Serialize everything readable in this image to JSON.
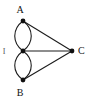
{
  "figure": {
    "name": "multigraph-diagram",
    "background": "#ffffff",
    "stroke_color": "#1c1c1c",
    "vertex_color": "#101010",
    "width": 88,
    "height": 101
  },
  "vertices": [
    {
      "id": "A",
      "label": "A",
      "x": 23,
      "y": 21,
      "label_x": 20,
      "label_y": 13
    },
    {
      "id": "I",
      "label": "I",
      "x": 23,
      "y": 51,
      "label_x": 4,
      "label_y": 54
    },
    {
      "id": "B",
      "label": "B",
      "x": 23,
      "y": 80,
      "label_x": 20,
      "label_y": 96
    },
    {
      "id": "C",
      "label": "C",
      "x": 72,
      "y": 51,
      "label_x": 78,
      "label_y": 54
    }
  ],
  "edges": [
    {
      "id": "A-I-left",
      "from": "A",
      "to": "I",
      "type": "curve",
      "bow": "left",
      "d": "M 23 21 C 12 29 12 43 23 51"
    },
    {
      "id": "A-I-right",
      "from": "A",
      "to": "I",
      "type": "curve",
      "bow": "right",
      "d": "M 23 21 C 34 29 34 43 23 51"
    },
    {
      "id": "I-B-left",
      "from": "I",
      "to": "B",
      "type": "curve",
      "bow": "left",
      "d": "M 23 51 C 12 59 12 72 23 80"
    },
    {
      "id": "I-B-right",
      "from": "I",
      "to": "B",
      "type": "curve",
      "bow": "right",
      "d": "M 23 51 C 34 59 34 72 23 80"
    },
    {
      "id": "A-C",
      "from": "A",
      "to": "C",
      "type": "line",
      "d": "M 23 21 L 72 51"
    },
    {
      "id": "I-C",
      "from": "I",
      "to": "C",
      "type": "line",
      "d": "M 23 51 L 72 51"
    },
    {
      "id": "B-C",
      "from": "B",
      "to": "C",
      "type": "line",
      "d": "M 23 80 L 72 51"
    }
  ],
  "caption": ""
}
